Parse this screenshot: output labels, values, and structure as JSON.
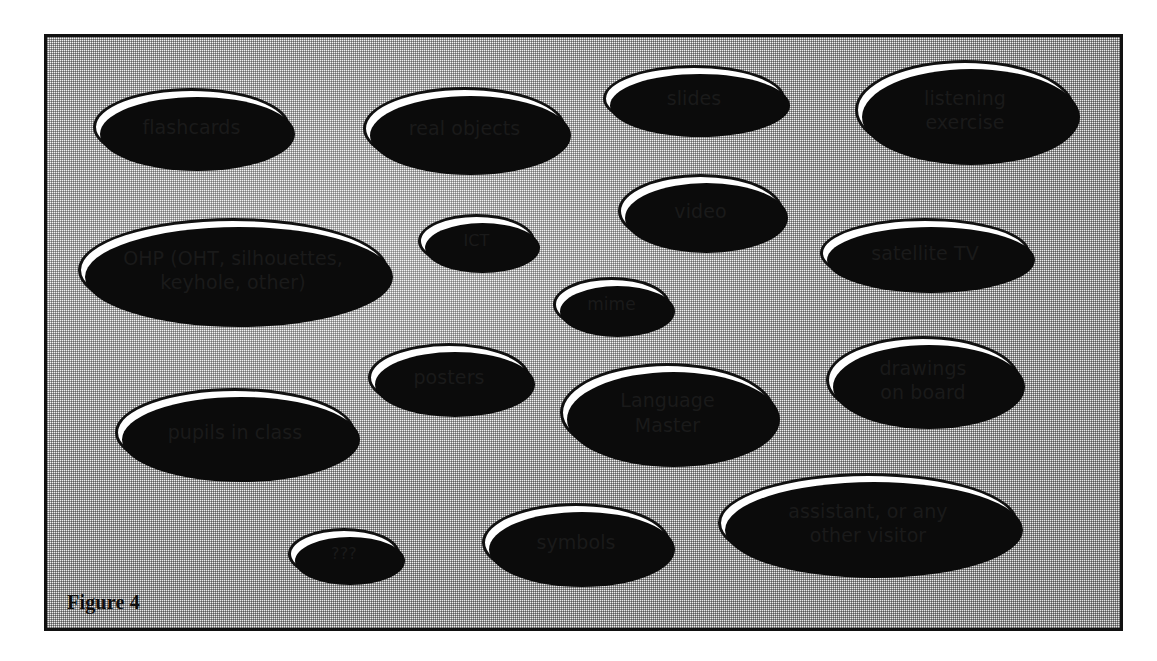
{
  "figure": {
    "caption": "Figure 4",
    "frame": {
      "background_color": "#f2f2f2",
      "border_color": "#111111",
      "fill_color": "#ffffff",
      "shadow_color": "#0b0b0b"
    }
  },
  "nodes": [
    {
      "id": "flashcards",
      "label": "flashcards",
      "x": 93,
      "y": 88,
      "w": 197,
      "h": 78,
      "size": "md"
    },
    {
      "id": "real-objects",
      "label": "real objects",
      "x": 363,
      "y": 87,
      "w": 203,
      "h": 83,
      "size": "md"
    },
    {
      "id": "slides",
      "label": "slides",
      "x": 603,
      "y": 65,
      "w": 182,
      "h": 67,
      "size": "md"
    },
    {
      "id": "listening-exercise",
      "label": "listening\nexercise",
      "x": 855,
      "y": 60,
      "w": 220,
      "h": 100,
      "size": "md"
    },
    {
      "id": "ohp",
      "label": "OHP (OHT, silhouettes,\nkeyhole, other)",
      "x": 78,
      "y": 218,
      "w": 310,
      "h": 104,
      "size": "md"
    },
    {
      "id": "ict",
      "label": "ICT",
      "x": 418,
      "y": 214,
      "w": 117,
      "h": 54,
      "size": "xs"
    },
    {
      "id": "video",
      "label": "video",
      "x": 618,
      "y": 174,
      "w": 165,
      "h": 74,
      "size": "md"
    },
    {
      "id": "satellite-tv",
      "label": "satellite TV",
      "x": 820,
      "y": 218,
      "w": 210,
      "h": 70,
      "size": "md"
    },
    {
      "id": "mime",
      "label": "mime",
      "x": 553,
      "y": 277,
      "w": 117,
      "h": 55,
      "size": "sm"
    },
    {
      "id": "posters",
      "label": "posters",
      "x": 368,
      "y": 343,
      "w": 162,
      "h": 69,
      "size": "md"
    },
    {
      "id": "drawings-on-board",
      "label": "drawings\non board",
      "x": 826,
      "y": 336,
      "w": 194,
      "h": 88,
      "size": "md"
    },
    {
      "id": "language-master",
      "label": "Language\nMaster",
      "x": 560,
      "y": 363,
      "w": 215,
      "h": 99,
      "size": "md"
    },
    {
      "id": "pupils-in-class",
      "label": "pupils in class",
      "x": 115,
      "y": 388,
      "w": 240,
      "h": 89,
      "size": "md"
    },
    {
      "id": "unknown",
      "label": "???",
      "x": 288,
      "y": 528,
      "w": 112,
      "h": 52,
      "size": "xs"
    },
    {
      "id": "symbols",
      "label": "symbols",
      "x": 482,
      "y": 503,
      "w": 188,
      "h": 79,
      "size": "md"
    },
    {
      "id": "assistant",
      "label": "assistant, or any\nother visitor",
      "x": 718,
      "y": 473,
      "w": 300,
      "h": 100,
      "size": "md"
    }
  ]
}
